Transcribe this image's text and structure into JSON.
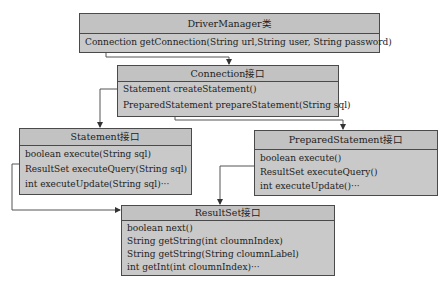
{
  "diagram": {
    "nodes": [
      {
        "id": "driver_manager",
        "title": "DriverManager类",
        "members": [
          "Connection getConnection(String url,String user, String password)"
        ]
      },
      {
        "id": "connection",
        "title": "Connection接口",
        "members": [
          "Statement createStatement()",
          "PreparedStatement prepareStatement(String sql)"
        ]
      },
      {
        "id": "statement",
        "title": "Statement接口",
        "members": [
          "boolean execute(String sql)",
          "ResultSet executeQuery(String sql)",
          "int executeUpdate(String sql)···"
        ]
      },
      {
        "id": "prepared_statement",
        "title": "PreparedStatement接口",
        "members": [
          "boolean execute()",
          "ResultSet executeQuery()",
          "int executeUpdate()···"
        ]
      },
      {
        "id": "result_set",
        "title": "ResultSet接口",
        "members": [
          "boolean next()",
          "String getString(int cloumnIndex)",
          "String getString(String cloumnLabel)",
          "int getInt(int cloumnIndex)···"
        ]
      }
    ],
    "edges": [
      {
        "from": "driver_manager",
        "to": "connection",
        "via": "getConnection"
      },
      {
        "from": "connection",
        "to": "statement",
        "via": "createStatement"
      },
      {
        "from": "connection",
        "to": "prepared_statement",
        "via": "prepareStatement"
      },
      {
        "from": "statement",
        "to": "result_set",
        "via": "executeQuery"
      },
      {
        "from": "prepared_statement",
        "to": "result_set",
        "via": "executeQuery"
      }
    ]
  }
}
